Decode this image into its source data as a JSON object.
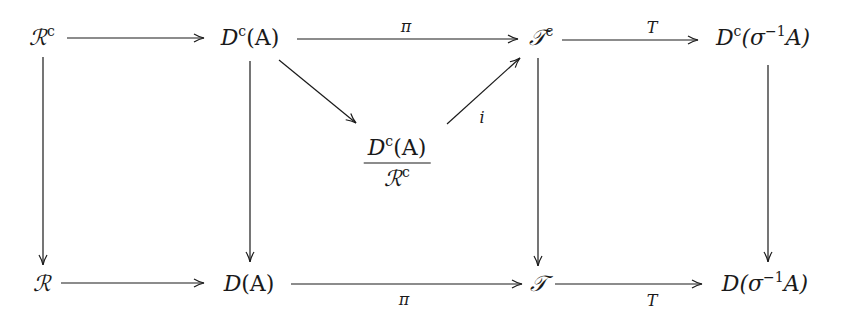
{
  "diagram": {
    "type": "commutative-diagram",
    "nodes": [
      {
        "id": "Rc",
        "base": "ℛ",
        "sup": "c",
        "tail": "",
        "x": 42,
        "y": 38
      },
      {
        "id": "DcA",
        "base": "D",
        "sup": "c",
        "tail": "(A)",
        "x": 250,
        "y": 38
      },
      {
        "id": "Tc",
        "base": "𝒯",
        "sup": "c",
        "tail": "",
        "x": 541,
        "y": 38
      },
      {
        "id": "DcSigmaA",
        "base": "D",
        "sup": "c",
        "tail": "(σ⁻¹A)",
        "x": 752,
        "y": 38
      },
      {
        "id": "quot",
        "numerator": "Dᶜ(A)",
        "denominator": "ℛᶜ",
        "x": 397,
        "y": 160
      },
      {
        "id": "R",
        "base": "ℛ",
        "sup": "",
        "tail": "",
        "x": 42,
        "y": 283
      },
      {
        "id": "DA",
        "base": "D",
        "sup": "",
        "tail": "(A)",
        "x": 250,
        "y": 283
      },
      {
        "id": "T",
        "base": "𝒯",
        "sup": "",
        "tail": "",
        "x": 541,
        "y": 283
      },
      {
        "id": "DSigmaA",
        "base": "D",
        "sup": "",
        "tail": "(σ⁻¹A)",
        "x": 752,
        "y": 283
      }
    ],
    "arrows": [
      {
        "from": "Rc",
        "to": "DcA",
        "label": ""
      },
      {
        "from": "DcA",
        "to": "Tc",
        "label": "π",
        "label_pos": "above"
      },
      {
        "from": "Tc",
        "to": "DcSigmaA",
        "label": "T",
        "label_pos": "above"
      },
      {
        "from": "DcA",
        "to": "quot",
        "label": ""
      },
      {
        "from": "quot",
        "to": "Tc",
        "label": "i",
        "label_pos": "right"
      },
      {
        "from": "Rc",
        "to": "R",
        "label": ""
      },
      {
        "from": "DcA",
        "to": "DA",
        "label": ""
      },
      {
        "from": "Tc",
        "to": "T",
        "label": ""
      },
      {
        "from": "DcSigmaA",
        "to": "DSigmaA",
        "label": ""
      },
      {
        "from": "R",
        "to": "DA",
        "label": ""
      },
      {
        "from": "DA",
        "to": "T",
        "label": "π",
        "label_pos": "below"
      },
      {
        "from": "T",
        "to": "DSigmaA",
        "label": "T",
        "label_pos": "below"
      }
    ],
    "labels": {
      "pi_top": "π",
      "T_top": "T",
      "i": "i",
      "pi_bottom": "π",
      "T_bottom": "T"
    },
    "text": {
      "Rc_base": "ℛ",
      "Rc_sup": "c",
      "DcA_base": "D",
      "DcA_sup": "c",
      "DcA_tail": "(A)",
      "Tc_base": "𝒯",
      "Tc_sup": "c",
      "DcS_base": "D",
      "DcS_sup": "c",
      "DcS_tail_open": "(σ",
      "DcS_tail_sup": "−1",
      "DcS_tail_close": "A)",
      "quot_num_base": "D",
      "quot_num_sup": "c",
      "quot_num_tail": "(A)",
      "quot_den_base": "ℛ",
      "quot_den_sup": "c",
      "R_base": "ℛ",
      "DA_base": "D",
      "DA_tail": "(A)",
      "T_base": "𝒯",
      "DS_base": "D",
      "DS_tail_open": "(σ",
      "DS_tail_sup": "−1",
      "DS_tail_close": "A)"
    },
    "colors": {
      "ink": "#1a1a1a",
      "background": "#ffffff"
    }
  }
}
